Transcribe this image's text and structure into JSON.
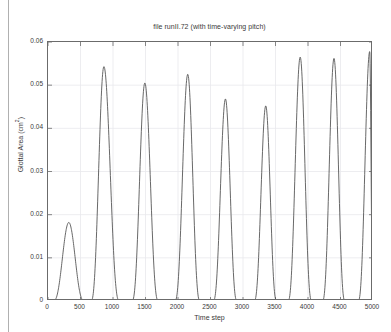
{
  "figure": {
    "title": "file runII.72 (with time-varying pitch)",
    "xlabel": "Time step",
    "ylabel_main": "Glottal Area (cm",
    "ylabel_sup": "2",
    "ylabel_tail": ")",
    "axis_color": "#6b6b6b",
    "line_color": "#4d4d4d",
    "grid_color": "#e8e8ec",
    "background": "#ffffff"
  },
  "chart_data": {
    "type": "line",
    "title": "file runII.72 (with time-varying pitch)",
    "xlabel": "Time step",
    "ylabel": "Glottal Area (cm^2)",
    "xlim": [
      0,
      5000
    ],
    "ylim": [
      0,
      0.06
    ],
    "xticks": [
      0,
      500,
      1000,
      1500,
      2000,
      2500,
      3000,
      3500,
      4000,
      4500,
      5000
    ],
    "yticks": [
      0,
      0.01,
      0.02,
      0.03,
      0.04,
      0.05,
      0.06
    ],
    "grid": true,
    "legend": null,
    "series": [
      {
        "name": "Glottal Area",
        "description": "Sequence of glottal-area pulses; pulse period decreases and peak amplitude grows with time (time-varying pitch). Area returns to 0 between pulses (closed phase).",
        "pulses": [
          {
            "peak_x": 320,
            "peak_y": 0.0182,
            "onset_x": 80,
            "offset_x": 560
          },
          {
            "peak_x": 860,
            "peak_y": 0.0543,
            "onset_x": 660,
            "offset_x": 1100
          },
          {
            "peak_x": 1490,
            "peak_y": 0.0505,
            "onset_x": 1290,
            "offset_x": 1700
          },
          {
            "peak_x": 2150,
            "peak_y": 0.0525,
            "onset_x": 1950,
            "offset_x": 2340
          },
          {
            "peak_x": 2730,
            "peak_y": 0.0468,
            "onset_x": 2540,
            "offset_x": 2910
          },
          {
            "peak_x": 3350,
            "peak_y": 0.0452,
            "onset_x": 3170,
            "offset_x": 3520
          },
          {
            "peak_x": 3880,
            "peak_y": 0.0565,
            "onset_x": 3690,
            "offset_x": 4060
          },
          {
            "peak_x": 4400,
            "peak_y": 0.0562,
            "onset_x": 4220,
            "offset_x": 4570
          },
          {
            "peak_x": 4950,
            "peak_y": 0.0578,
            "onset_x": 4770,
            "offset_x": 5000
          }
        ]
      }
    ]
  }
}
